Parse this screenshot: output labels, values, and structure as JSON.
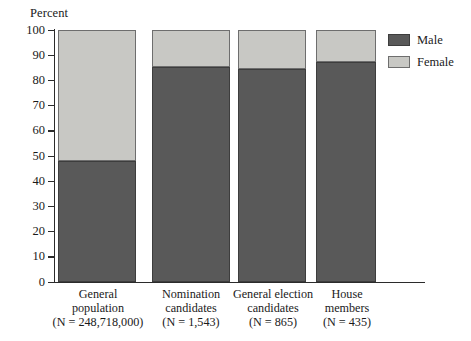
{
  "chart_data": {
    "type": "bar",
    "title": "",
    "subtitle": "",
    "xlabel": "",
    "ylabel": "Percent",
    "ylim": [
      0,
      100
    ],
    "ytick_labels": [
      "100",
      "90",
      "80",
      "70",
      "60",
      "50",
      "40",
      "30",
      "20",
      "10",
      "0"
    ],
    "ytick_values": [
      100,
      90,
      80,
      70,
      60,
      50,
      40,
      30,
      20,
      10,
      0
    ],
    "grid": false,
    "stacked": true,
    "legend_position": "right-top",
    "categories": [
      "General population",
      "Nomination candidates",
      "General election candidates",
      "House members"
    ],
    "category_lines": [
      [
        "General",
        "population",
        "(N = 248,718,000)"
      ],
      [
        "Nomination",
        "candidates",
        "(N = 1,543)"
      ],
      [
        "General election",
        "candidates",
        "(N = 865)"
      ],
      [
        "House",
        "members",
        "(N = 435)"
      ]
    ],
    "category_counts": [
      "248,718,000",
      "1,543",
      "865",
      "435"
    ],
    "series": [
      {
        "name": "Male",
        "color": "#595959",
        "values": [
          48.0,
          85.5,
          84.5,
          87.5
        ]
      },
      {
        "name": "Female",
        "color": "#c8c8c4",
        "values": [
          52.0,
          14.5,
          15.5,
          12.5
        ]
      }
    ]
  },
  "legend": {
    "items": [
      {
        "label": "Male",
        "swatch": "male-swatch"
      },
      {
        "label": "Female",
        "swatch": "female-swatch"
      }
    ]
  }
}
